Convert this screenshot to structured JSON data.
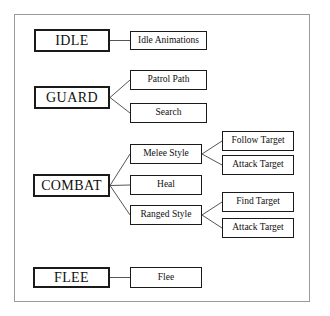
{
  "figure": {
    "background_color": "#ffffff",
    "frame_color": "#9a9a9a",
    "box_border_color": "#1a1a1a",
    "connector_color": "#555555"
  },
  "states": [
    {
      "id": "idle",
      "label": "IDLE"
    },
    {
      "id": "guard",
      "label": "GUARD"
    },
    {
      "id": "combat",
      "label": "COMBAT"
    },
    {
      "id": "flee",
      "label": "FLEE"
    }
  ],
  "actions": [
    {
      "id": "idle-animations",
      "label": "Idle Animations",
      "parent": "idle"
    },
    {
      "id": "patrol-path",
      "label": "Patrol Path",
      "parent": "guard"
    },
    {
      "id": "search",
      "label": "Search",
      "parent": "guard"
    },
    {
      "id": "melee-style",
      "label": "Melee Style",
      "parent": "combat"
    },
    {
      "id": "heal",
      "label": "Heal",
      "parent": "combat"
    },
    {
      "id": "ranged-style",
      "label": "Ranged Style",
      "parent": "combat"
    },
    {
      "id": "flee-action",
      "label": "Flee",
      "parent": "flee"
    }
  ],
  "leaves": [
    {
      "id": "melee-follow-target",
      "label": "Follow Target",
      "parent": "melee-style"
    },
    {
      "id": "melee-attack-target",
      "label": "Attack Target",
      "parent": "melee-style"
    },
    {
      "id": "ranged-find-target",
      "label": "Find Target",
      "parent": "ranged-style"
    },
    {
      "id": "ranged-attack-target",
      "label": "Attack Target",
      "parent": "ranged-style"
    }
  ],
  "chart_data": {
    "type": "diagram",
    "nodes": [
      {
        "id": "idle",
        "label": "IDLE",
        "level": 0,
        "x": 34,
        "y": 29,
        "w": 76,
        "h": 23
      },
      {
        "id": "idle-animations",
        "label": "Idle Animations",
        "level": 1,
        "x": 130,
        "y": 31,
        "w": 77,
        "h": 19
      },
      {
        "id": "guard",
        "label": "GUARD",
        "level": 0,
        "x": 34,
        "y": 86,
        "w": 76,
        "h": 23
      },
      {
        "id": "patrol-path",
        "label": "Patrol Path",
        "level": 1,
        "x": 130,
        "y": 70,
        "w": 77,
        "h": 20
      },
      {
        "id": "search",
        "label": "Search",
        "level": 1,
        "x": 130,
        "y": 103,
        "w": 77,
        "h": 20
      },
      {
        "id": "combat",
        "label": "COMBAT",
        "level": 0,
        "x": 33,
        "y": 174,
        "w": 77,
        "h": 23
      },
      {
        "id": "melee-style",
        "label": "Melee Style",
        "level": 1,
        "x": 130,
        "y": 144,
        "w": 72,
        "h": 20
      },
      {
        "id": "heal",
        "label": "Heal",
        "level": 1,
        "x": 130,
        "y": 175,
        "w": 72,
        "h": 20
      },
      {
        "id": "ranged-style",
        "label": "Ranged Style",
        "level": 1,
        "x": 130,
        "y": 205,
        "w": 72,
        "h": 20
      },
      {
        "id": "melee-follow-target",
        "label": "Follow Target",
        "level": 2,
        "x": 222,
        "y": 131,
        "w": 72,
        "h": 20
      },
      {
        "id": "melee-attack-target",
        "label": "Attack Target",
        "level": 2,
        "x": 222,
        "y": 155,
        "w": 72,
        "h": 20
      },
      {
        "id": "ranged-find-target",
        "label": "Find Target",
        "level": 2,
        "x": 222,
        "y": 192,
        "w": 72,
        "h": 20
      },
      {
        "id": "ranged-attack-target",
        "label": "Attack Target",
        "level": 2,
        "x": 222,
        "y": 218,
        "w": 72,
        "h": 20
      },
      {
        "id": "flee",
        "label": "FLEE",
        "level": 0,
        "x": 33,
        "y": 267,
        "w": 77,
        "h": 21
      },
      {
        "id": "flee-action",
        "label": "Flee",
        "level": 1,
        "x": 130,
        "y": 267,
        "w": 72,
        "h": 21
      }
    ],
    "edges": [
      {
        "from": "idle",
        "to": "idle-animations"
      },
      {
        "from": "guard",
        "to": "patrol-path"
      },
      {
        "from": "guard",
        "to": "search"
      },
      {
        "from": "combat",
        "to": "melee-style"
      },
      {
        "from": "combat",
        "to": "heal"
      },
      {
        "from": "combat",
        "to": "ranged-style"
      },
      {
        "from": "melee-style",
        "to": "melee-follow-target"
      },
      {
        "from": "melee-style",
        "to": "melee-attack-target"
      },
      {
        "from": "ranged-style",
        "to": "ranged-find-target"
      },
      {
        "from": "ranged-style",
        "to": "ranged-attack-target"
      },
      {
        "from": "flee",
        "to": "flee-action"
      }
    ]
  }
}
